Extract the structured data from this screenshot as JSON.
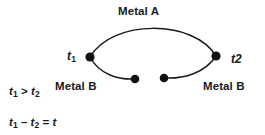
{
  "diagram": {
    "stroke_color": "#1a1a1a",
    "background_color": "#ffffff",
    "labels": {
      "metal_a": "Metal A",
      "metal_b_left": "Metal B",
      "metal_b_right": "Metal B",
      "junction_left": "t",
      "junction_left_sub": "1",
      "junction_right": "t2"
    },
    "formulas": {
      "inequality": {
        "lhs": "t",
        "lhs_sub": "1",
        "operator": ">",
        "rhs": "t",
        "rhs_sub": "2"
      },
      "difference": {
        "a": "t",
        "a_sub": "1",
        "minus": "–",
        "b": "t",
        "b_sub": "2",
        "equals": "=",
        "result": "t"
      }
    },
    "nodes": [
      {
        "name": "junction-left",
        "x": 90,
        "y": 57,
        "r": 4.6
      },
      {
        "name": "junction-right",
        "x": 216,
        "y": 56,
        "r": 4.6
      },
      {
        "name": "terminal-left",
        "x": 135,
        "y": 79,
        "r": 4.3
      },
      {
        "name": "terminal-right",
        "x": 164,
        "y": 78,
        "r": 4.3
      }
    ],
    "curves": [
      {
        "name": "metal-a-arc",
        "from": [
          90,
          57
        ],
        "to": [
          216,
          56
        ],
        "apex_y": 26
      },
      {
        "name": "metal-b-arc-left",
        "from": [
          90,
          57
        ],
        "to": [
          135,
          79
        ]
      },
      {
        "name": "metal-b-arc-right",
        "from": [
          164,
          78
        ],
        "to": [
          216,
          56
        ]
      }
    ]
  }
}
